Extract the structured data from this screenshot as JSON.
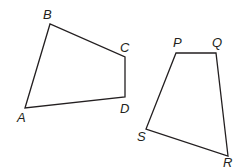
{
  "figure": {
    "quadrilaterals": [
      {
        "name": "ABCD",
        "vertices": [
          {
            "label": "A",
            "x": 25,
            "y": 108,
            "lx": 17,
            "ly": 122
          },
          {
            "label": "B",
            "x": 50,
            "y": 24,
            "lx": 43,
            "ly": 19
          },
          {
            "label": "C",
            "x": 125,
            "y": 57,
            "lx": 120,
            "ly": 52
          },
          {
            "label": "D",
            "x": 125,
            "y": 97,
            "lx": 120,
            "ly": 113
          }
        ]
      },
      {
        "name": "PQRS",
        "vertices": [
          {
            "label": "P",
            "x": 176,
            "y": 53,
            "lx": 173,
            "ly": 47
          },
          {
            "label": "Q",
            "x": 216,
            "y": 53,
            "lx": 212,
            "ly": 47
          },
          {
            "label": "R",
            "x": 228,
            "y": 156,
            "lx": 223,
            "ly": 167
          },
          {
            "label": "S",
            "x": 146,
            "y": 129,
            "lx": 137,
            "ly": 141
          }
        ]
      }
    ],
    "stroke_color": "#231f20"
  }
}
